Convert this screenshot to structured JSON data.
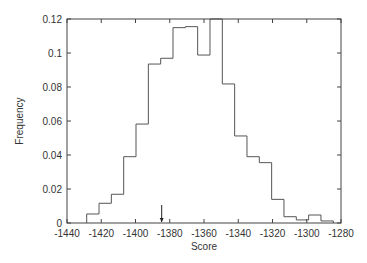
{
  "chart_data": {
    "type": "histogram",
    "title": "",
    "xlabel": "Score",
    "ylabel": "Frequency",
    "xlim": [
      -1440,
      -1280
    ],
    "ylim": [
      0,
      0.12
    ],
    "xticks": [
      -1440,
      -1420,
      -1400,
      -1380,
      -1360,
      -1340,
      -1320,
      -1300,
      -1280
    ],
    "xtick_labels": [
      "-1440",
      "-1420",
      "-1400",
      "-1380",
      "-1360",
      "-1340",
      "-1320",
      "-1300",
      "-1280"
    ],
    "yticks": [
      0,
      0.02,
      0.04,
      0.06,
      0.08,
      0.1,
      0.12
    ],
    "ytick_labels": [
      "0",
      "0.02",
      "0.04",
      "0.06",
      "0.08",
      "0.1",
      "0.12"
    ],
    "grid": false,
    "legend": null,
    "bin_edges": [
      -1428.5,
      -1421.3,
      -1414.1,
      -1406.9,
      -1399.7,
      -1392.5,
      -1385.3,
      -1378.1,
      -1370.9,
      -1363.7,
      -1356.5,
      -1349.3,
      -1342.1,
      -1334.9,
      -1327.7,
      -1320.5,
      -1313.3,
      -1306.1,
      -1298.9,
      -1291.7,
      -1284.5
    ],
    "values": [
      0.0053,
      0.0116,
      0.0169,
      0.039,
      0.0582,
      0.0935,
      0.0969,
      0.1149,
      0.1155,
      0.0988,
      0.12,
      0.0818,
      0.0512,
      0.039,
      0.0355,
      0.0139,
      0.0037,
      0.0018,
      0.0047,
      0.0012
    ],
    "annotations": [
      {
        "type": "arrow",
        "x": -1384.7,
        "description": "downward arrow marker on x-axis"
      }
    ]
  },
  "colors": {
    "line": "#555555",
    "frame": "#444444",
    "text": "#333333",
    "background": "#ffffff"
  }
}
